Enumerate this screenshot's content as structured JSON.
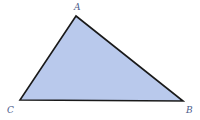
{
  "diagram": {
    "type": "triangle",
    "fill_color": "#b9c9ec",
    "stroke_color": "#1a1a1a",
    "label_color": "#4a5a8a",
    "vertices": [
      {
        "label": "A",
        "x": 76,
        "y": 16
      },
      {
        "label": "B",
        "x": 183,
        "y": 101
      },
      {
        "label": "C",
        "x": 20,
        "y": 100
      }
    ],
    "labels": {
      "a": "A",
      "b": "B",
      "c": "C"
    }
  }
}
